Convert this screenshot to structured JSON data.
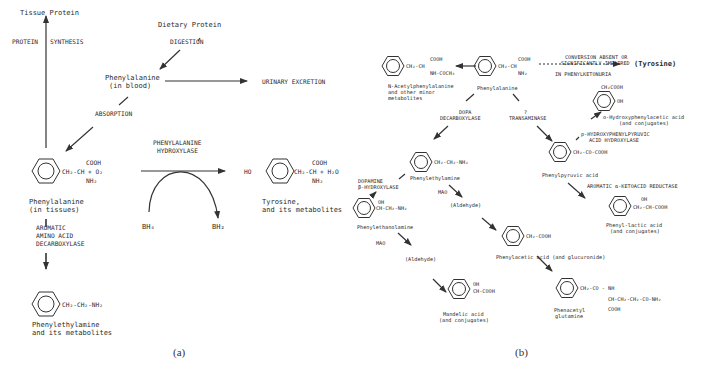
{
  "panel_a": {
    "caption": "(a)",
    "tissue_protein": "Tissue Protein",
    "protein_synthesis_left": "PROTEIN",
    "protein_synthesis_right": "SYNTHESIS",
    "dietary_protein": "Dietary Protein",
    "digestion": "DIGESTION",
    "phe_blood_1": "Phenylalanine",
    "phe_blood_2": "(in blood)",
    "urinary_excretion": "URINARY EXCRETION",
    "absorption": "ABSORPTION",
    "enzyme_1": "PHENYLALANINE",
    "enzyme_2": "HYDROXYLASE",
    "phe_formula_cooh": "COOH",
    "phe_formula_main": "CH₂-CH + O₂",
    "phe_formula_nh2": "NH₂",
    "phe_tissue_1": "Phenylalanine",
    "phe_tissue_2": "(in tissues)",
    "decarbox_1": "AROMATIC",
    "decarbox_2": "AMINO ACID",
    "decarbox_3": "DECARBOXYLASE",
    "bh4": "BH₄",
    "bh2": "BH₂",
    "tyr_ho": "HO",
    "tyr_cooh": "COOH",
    "tyr_main": "CH₂-CH + H₂O",
    "tyr_nh2": "NH₂",
    "tyr_label_1": "Tyrosine,",
    "tyr_label_2": "and its metabolites",
    "pea_formula": "CH₂-CH₂-NH₂",
    "pea_label_1": "Phenylethylamine",
    "pea_label_2": "and its metabolites"
  },
  "panel_b": {
    "caption": "(b)",
    "nacetyl_cooh": "COOH",
    "nacetyl_main": "CH₂-CH",
    "nacetyl_sub": "NH-COCH₃",
    "nacetyl_label_1": "N-Acetylphenylalanine",
    "nacetyl_label_2": "and other minor",
    "nacetyl_label_3": "metabolites",
    "phe_cooh": "COOH",
    "phe_main": "CH₂-CH",
    "phe_nh2": "NH₂",
    "phe_label": "Phenylalanine",
    "conv_1": "CONVERSION ABSENT OR",
    "conv_2": "SIGNIFICANTLY IMPAIRED",
    "conv_3": "IN PHENYLKETONURIA",
    "tyrosine": "(Tyrosine)",
    "dopa_1": "DOPA",
    "dopa_2": "DECARBOXYLASE",
    "trans_1": "?",
    "trans_2": "TRANSAMINASE",
    "pea_formula": "CH₂-CH₂-NH₂",
    "pea_label": "Phenylethylamine",
    "ohpa_top": "CH₂COOH",
    "ohpa_oh": "OH",
    "ohpa_label_1": "o-Hydroxyphenylacetic acid",
    "ohpa_label_2": "(and conjugates)",
    "pphh_1": "p-HYDROXYPHENYLPYRUVIC",
    "pphh_2": "ACID HYDROXYLASE",
    "ppa_formula": "CH₂-CO-COOH",
    "ppa_label": "Phenylpyruvic acid",
    "reductase": "AROMATIC α-KETOACID REDUCTASE",
    "pla_oh": "OH",
    "pla_formula": "CH₂-CH-COOH",
    "pla_label_1": "Phenyl-lactic acid",
    "pla_label_2": "(and conjugates)",
    "dbh_1": "DOPAMINE",
    "dbh_2": "β-HYDROXYLASE",
    "pea_mao": "MAO",
    "aldehyde_1": "(Aldehyde)",
    "pethanol_oh": "OH",
    "pethanol_formula": "CH-CH₂-NH₂",
    "pethanol_label": "Phenylethanolamine",
    "pethanol_mao": "MAO",
    "aldehyde_2": "(Aldehyde)",
    "paa_formula": "CH₂-COOH",
    "paa_label": "Phenylacetic acid (and glucuronide)",
    "mandelic_oh": "OH",
    "mandelic_formula": "CH-COOH",
    "mandelic_label_1": "Mandelic acid",
    "mandelic_label_2": "(and conjugates)",
    "pag_formula_1": "CH₂-CO - NH",
    "pag_formula_2": "CH-CH₂-CH₂-CO-NH₂",
    "pag_formula_3": "COOH",
    "pag_label_1": "Phenacetyl",
    "pag_label_2": "glutamine"
  }
}
